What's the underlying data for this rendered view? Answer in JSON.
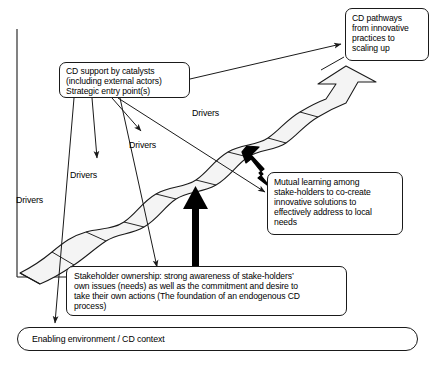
{
  "figure": {
    "type": "conceptual-diagram",
    "title_visible": false,
    "background_color": "#ffffff",
    "stroke_color": "#1a1a1a",
    "ribbon_fill": "#f4f4f4",
    "bold_arrow_color": "#000000"
  },
  "boxes": {
    "cd_pathways": {
      "text": "CD pathways\nfrom innovative\npractices to\nscaling up"
    },
    "cd_support": {
      "text": "CD support by catalysts\n(including external actors)\nStrategic entry point(s)"
    },
    "mutual_learning": {
      "text": "Mutual learning among\nstake-holders to co-create\ninnovative solutions to\neffectively address to local\nneeds"
    },
    "stakeholder_ownership": {
      "text": "Stakeholder ownership: strong awareness of stake-holders’\nown issues (needs) as well as the commitment and desire to\ntake their own actions (The foundation of an endogenous CD\nprocess)"
    },
    "enabling_environment": {
      "text": "Enabling environment / CD context"
    }
  },
  "drivers": [
    {
      "label": "Drivers"
    },
    {
      "label": "Drivers"
    },
    {
      "label": "Drivers"
    },
    {
      "label": "Drivers"
    }
  ],
  "connectors": [
    {
      "name": "cd-support-to-cd-pathways",
      "style": "thin-arrow"
    },
    {
      "name": "cd-support-to-driver-3",
      "style": "thin-arrow"
    },
    {
      "name": "cd-support-to-driver-1",
      "style": "thin-arrow"
    },
    {
      "name": "cd-support-to-ribbon",
      "style": "thin-arrow"
    },
    {
      "name": "cd-support-to-enabling-environment",
      "style": "thin-arrow"
    },
    {
      "name": "cd-pathways-to-ribbon-arrowhead",
      "style": "thin-leader"
    },
    {
      "name": "mutual-learning-leader",
      "style": "thin-leader"
    },
    {
      "name": "stakeholder-ownership-to-ribbon",
      "style": "bold-arrow-up"
    },
    {
      "name": "mutual-learning-to-ribbon",
      "style": "bold-arrow-diagonal"
    }
  ],
  "axes": {
    "shape": "L-shaped",
    "vertical": true,
    "horizontal": true
  },
  "ribbon": {
    "name": "cd-pathway-ribbon",
    "description": "wavy rising band with segment dividers ending in a hollow arrowhead at upper right",
    "segment_count": 5
  }
}
